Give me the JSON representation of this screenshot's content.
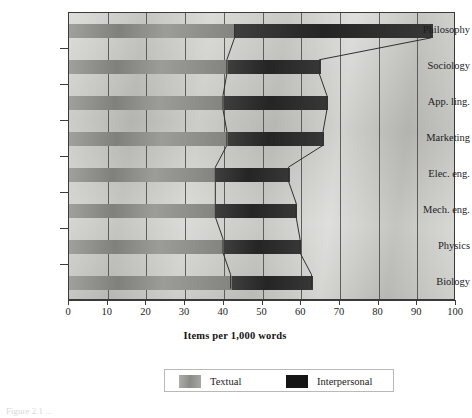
{
  "figure": {
    "caption_fragment": "Figure 2.1  ...",
    "axis_title": "Items per 1,000 words"
  },
  "legend": {
    "position": "bottom-center",
    "entries": [
      {
        "label": "Textual",
        "color": "#8e8e8a",
        "swatch": "textual-swatch"
      },
      {
        "label": "Interpersonal",
        "color": "#2b2b2b",
        "swatch": "interpersonal-swatch"
      }
    ]
  },
  "axes": {
    "x": {
      "title": "Items per 1,000 words",
      "min": 0,
      "max": 100,
      "step": 10,
      "ticks": [
        "0",
        "10",
        "20",
        "30",
        "40",
        "50",
        "60",
        "70",
        "80",
        "90",
        "100"
      ]
    },
    "y": {
      "categories": [
        "Philosophy",
        "Sociology",
        "App. ling.",
        "Marketing",
        "Elec. eng.",
        "Mech. eng.",
        "Physics",
        "Biology"
      ]
    }
  },
  "chart_data": {
    "type": "bar",
    "orientation": "horizontal",
    "stacked": true,
    "title": "",
    "subtitle": "",
    "xlabel": "Items per 1,000 words",
    "ylabel": "",
    "xlim": [
      0,
      100
    ],
    "grid": "vertical",
    "legend_position": "bottom-center",
    "categories": [
      "Philosophy",
      "Sociology",
      "App. ling.",
      "Marketing",
      "Elec. eng.",
      "Mech. eng.",
      "Physics",
      "Biology"
    ],
    "series": [
      {
        "name": "Textual",
        "color": "#8e8e8a",
        "values": [
          43,
          41,
          40,
          41,
          38,
          38,
          40,
          42
        ]
      },
      {
        "name": "Interpersonal",
        "color": "#2b2b2b",
        "values": [
          51,
          24,
          27,
          25,
          19,
          21,
          20,
          21
        ]
      }
    ],
    "totals": [
      94,
      65,
      67,
      66,
      57,
      59,
      60,
      63
    ],
    "annotations": [
      "Polyline connects the Textual/Interpersonal boundary and the bar ends across categories"
    ]
  }
}
